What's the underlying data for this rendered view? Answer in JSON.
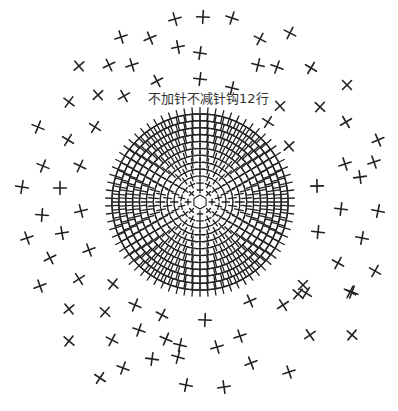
{
  "diagram": {
    "type": "crochet-chart",
    "stitch_symbol": "x",
    "stitch_name": "single-crochet",
    "annotation": "不加针不减针钩12行",
    "center": [
      200,
      202
    ],
    "dense_disc": {
      "inner_radius": 6,
      "outer_radius": 92,
      "rounds": 12
    },
    "ink_color": "#222222",
    "label_color": "#333333",
    "outer_marks": [
      [
        175,
        19
      ],
      [
        203,
        17
      ],
      [
        232,
        18
      ],
      [
        121,
        37
      ],
      [
        150,
        38
      ],
      [
        178,
        47
      ],
      [
        200,
        53
      ],
      [
        260,
        39
      ],
      [
        290,
        33
      ],
      [
        79,
        66
      ],
      [
        109,
        65
      ],
      [
        132,
        65
      ],
      [
        258,
        65
      ],
      [
        277,
        67
      ],
      [
        311,
        68
      ],
      [
        98,
        95
      ],
      [
        124,
        96
      ],
      [
        200,
        79
      ],
      [
        232,
        88
      ],
      [
        347,
        85
      ],
      [
        69,
        102
      ],
      [
        157,
        81
      ],
      [
        280,
        106
      ],
      [
        320,
        107
      ],
      [
        346,
        122
      ],
      [
        38,
        127
      ],
      [
        95,
        127
      ],
      [
        268,
        122
      ],
      [
        378,
        140
      ],
      [
        68,
        140
      ],
      [
        43,
        166
      ],
      [
        80,
        166
      ],
      [
        289,
        146
      ],
      [
        345,
        164
      ],
      [
        374,
        162
      ],
      [
        22,
        187
      ],
      [
        60,
        188
      ],
      [
        317,
        186
      ],
      [
        360,
        177
      ],
      [
        42,
        215
      ],
      [
        81,
        211
      ],
      [
        341,
        209
      ],
      [
        378,
        211
      ],
      [
        27,
        238
      ],
      [
        62,
        233
      ],
      [
        318,
        232
      ],
      [
        362,
        238
      ],
      [
        50,
        258
      ],
      [
        89,
        250
      ],
      [
        338,
        263
      ],
      [
        375,
        271
      ],
      [
        40,
        286
      ],
      [
        79,
        279
      ],
      [
        113,
        284
      ],
      [
        303,
        285
      ],
      [
        350,
        292
      ],
      [
        306,
        293
      ],
      [
        69,
        309
      ],
      [
        105,
        312
      ],
      [
        135,
        305
      ],
      [
        162,
        315
      ],
      [
        250,
        301
      ],
      [
        283,
        305
      ],
      [
        298,
        294
      ],
      [
        352,
        292
      ],
      [
        69,
        341
      ],
      [
        112,
        340
      ],
      [
        139,
        330
      ],
      [
        166,
        339
      ],
      [
        205,
        320
      ],
      [
        240,
        336
      ],
      [
        310,
        335
      ],
      [
        352,
        335
      ],
      [
        123,
        368
      ],
      [
        152,
        359
      ],
      [
        178,
        357
      ],
      [
        217,
        347
      ],
      [
        251,
        363
      ],
      [
        289,
        372
      ],
      [
        186,
        385
      ],
      [
        224,
        387
      ],
      [
        180,
        345
      ],
      [
        100,
        378
      ]
    ]
  }
}
